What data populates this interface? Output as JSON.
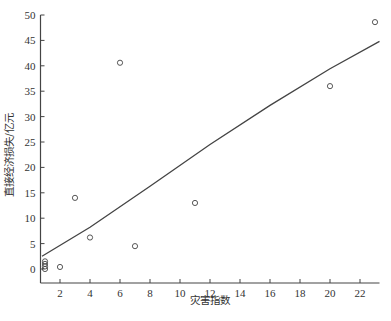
{
  "chart_data": {
    "type": "scatter",
    "title": "",
    "xlabel": "灾害指数",
    "ylabel": "直接经济损失/亿元",
    "xlim": [
      0.7,
      23.3
    ],
    "ylim": [
      -2,
      50
    ],
    "grid": false,
    "legend": null,
    "x_ticks": [
      2,
      4,
      6,
      8,
      10,
      12,
      14,
      16,
      18,
      20,
      22
    ],
    "y_ticks": [
      0,
      5,
      10,
      15,
      20,
      25,
      30,
      35,
      40,
      45,
      50
    ],
    "series": [
      {
        "name": "observations",
        "kind": "scatter",
        "marker": "open-circle",
        "points": [
          {
            "x": 1,
            "y": 0.0
          },
          {
            "x": 1,
            "y": 0.5
          },
          {
            "x": 1,
            "y": 1.0
          },
          {
            "x": 1,
            "y": 1.5
          },
          {
            "x": 2,
            "y": 0.4
          },
          {
            "x": 3,
            "y": 14.0
          },
          {
            "x": 4,
            "y": 6.2
          },
          {
            "x": 6,
            "y": 40.6
          },
          {
            "x": 7,
            "y": 4.5
          },
          {
            "x": 11,
            "y": 13.0
          },
          {
            "x": 20,
            "y": 36.0
          },
          {
            "x": 23,
            "y": 48.6
          }
        ]
      },
      {
        "name": "fit",
        "kind": "line",
        "points": [
          {
            "x": 0.8,
            "y": 2.5
          },
          {
            "x": 4,
            "y": 8.2
          },
          {
            "x": 8,
            "y": 16.3
          },
          {
            "x": 12,
            "y": 24.5
          },
          {
            "x": 16,
            "y": 32.2
          },
          {
            "x": 20,
            "y": 39.4
          },
          {
            "x": 23.3,
            "y": 44.8
          }
        ]
      }
    ]
  },
  "colors": {
    "axis": "#444444",
    "marker": "#444444",
    "line": "#444444"
  }
}
